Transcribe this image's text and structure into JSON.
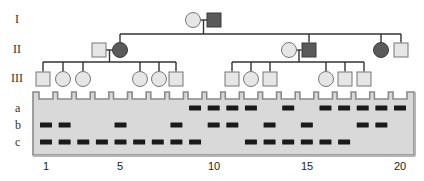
{
  "colors": {
    "affected": "#5a5a5a",
    "unaffected_fill": "#e6e6e6",
    "line": "#333333",
    "gel_fill": "#d9d9d9",
    "gel_border": "#8a8a8a",
    "band": "#1a1a1a"
  },
  "pedigree": {
    "generation_labels": [
      {
        "label": "I",
        "y": 20
      },
      {
        "label": "II",
        "y": 50
      },
      {
        "label": "III",
        "y": 79
      }
    ],
    "generation_I": [
      {
        "sex": "female",
        "affected": false,
        "x": 193
      },
      {
        "sex": "male",
        "affected": true,
        "x": 214
      }
    ],
    "generation_II": [
      {
        "sex": "male",
        "affected": false,
        "x": 99,
        "role": "spouse"
      },
      {
        "sex": "female",
        "affected": true,
        "x": 120,
        "role": "child"
      },
      {
        "sex": "female",
        "affected": false,
        "x": 289,
        "role": "spouse"
      },
      {
        "sex": "male",
        "affected": true,
        "x": 309,
        "role": "child"
      },
      {
        "sex": "female",
        "affected": true,
        "x": 381,
        "role": "child"
      },
      {
        "sex": "male",
        "affected": false,
        "x": 401,
        "role": "child"
      }
    ],
    "generation_III": [
      {
        "sex": "male",
        "affected": false,
        "x": 43,
        "lane": 1
      },
      {
        "sex": "female",
        "affected": false,
        "x": 63,
        "lane": 2
      },
      {
        "sex": "female",
        "affected": false,
        "x": 83,
        "lane": 3
      },
      {
        "sex": "female",
        "affected": false,
        "x": 140,
        "lane": 6
      },
      {
        "sex": "female",
        "affected": false,
        "x": 159,
        "lane": 7
      },
      {
        "sex": "male",
        "affected": false,
        "x": 176,
        "lane": 8
      },
      {
        "sex": "male",
        "affected": false,
        "x": 232,
        "lane": 11
      },
      {
        "sex": "female",
        "affected": false,
        "x": 251,
        "lane": 12
      },
      {
        "sex": "male",
        "affected": false,
        "x": 270,
        "lane": 13
      },
      {
        "sex": "female",
        "affected": false,
        "x": 326,
        "lane": 16
      },
      {
        "sex": "male",
        "affected": false,
        "x": 345,
        "lane": 17
      },
      {
        "sex": "male",
        "affected": false,
        "x": 364,
        "lane": 18
      }
    ]
  },
  "gel": {
    "row_labels": [
      "a",
      "b",
      "c"
    ],
    "lane_count": 20,
    "lane_numbers_shown": [
      {
        "label": "1",
        "lane": 1
      },
      {
        "label": "5",
        "lane": 5
      },
      {
        "label": "10",
        "lane": 10
      },
      {
        "label": "15",
        "lane": 15
      },
      {
        "label": "20",
        "lane": 20
      }
    ],
    "bands": {
      "a": [
        9,
        10,
        11,
        12,
        14,
        16,
        17,
        18,
        19,
        20
      ],
      "b": [
        1,
        2,
        5,
        8,
        10,
        11,
        13,
        15,
        18,
        19
      ],
      "c": [
        1,
        2,
        3,
        4,
        5,
        6,
        7,
        8,
        9,
        12,
        13,
        14,
        15,
        16,
        17
      ]
    }
  }
}
